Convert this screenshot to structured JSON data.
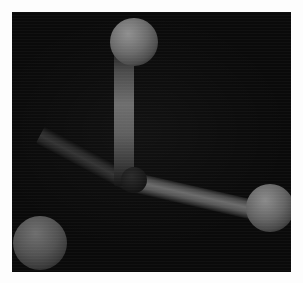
{
  "render": {
    "title": "Ball-and-stick molecular model",
    "canvas_background": "#0a0a0a",
    "page_background": "#ffffff",
    "canvas": {
      "x": 12,
      "y": 12,
      "width": 279,
      "height": 260
    }
  },
  "molecule": {
    "geometry_label": "trigonal pyramidal",
    "atom_count": "4",
    "bond_count": "3",
    "atoms": [
      {
        "id": "center",
        "label": "central atom",
        "cx": 122,
        "cy": 168,
        "r": 13,
        "color": "#202020"
      },
      {
        "id": "top",
        "label": "top atom",
        "cx": 122,
        "cy": 30,
        "r": 24,
        "color": "#7e7e7e"
      },
      {
        "id": "right",
        "label": "right atom",
        "cx": 258,
        "cy": 196,
        "r": 24,
        "color": "#787878"
      },
      {
        "id": "bottom-left",
        "label": "bottom left atom",
        "cx": 28,
        "cy": 231,
        "r": 27,
        "color": "#606060"
      }
    ],
    "bonds": [
      {
        "id": "bond-vertical",
        "label": "bond to top atom",
        "x": 112,
        "y": 38,
        "length": 136,
        "thickness": 20,
        "rotate": 90,
        "color": "#6e6e6e"
      },
      {
        "id": "bond-right",
        "label": "bond to right atom",
        "x": 120,
        "y": 170,
        "length": 128,
        "thickness": 20,
        "rotate": 13,
        "color": "#6b6b6b"
      },
      {
        "id": "bond-left",
        "label": "bond to bottom left atom",
        "x": 122,
        "y": 172,
        "length": 106,
        "thickness": 19,
        "rotate": 208,
        "color": "#343434"
      }
    ]
  }
}
